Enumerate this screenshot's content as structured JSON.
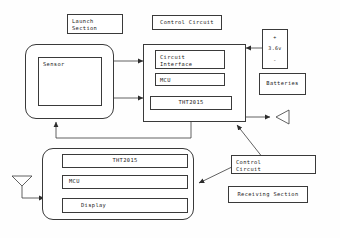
{
  "diagram": {
    "title_labels": {
      "launch_section": "Launch\nSection",
      "control_circuit_top": "Control Circuit",
      "batteries": "Batteries",
      "control_circuit_bottom": "Control\nCircuit",
      "receiving_section": "Receiving Section"
    },
    "transmitter": {
      "sensor_label": "Sensor",
      "control_blocks": [
        {
          "label": "Circuit\nInterface",
          "name": "circuit-interface-block"
        },
        {
          "label": "MCU",
          "name": "mcu-block"
        },
        {
          "label": "THT2015",
          "name": "tht2015-block"
        }
      ]
    },
    "battery": {
      "plus": "+",
      "voltage": "3.6v",
      "minus": "-"
    },
    "receiver": {
      "blocks": [
        {
          "label": "THT2015",
          "name": "receiver-tht2015-block"
        },
        {
          "label": "MCU",
          "name": "receiver-mcu-block"
        },
        {
          "label": "Display",
          "name": "receiver-display-block"
        }
      ]
    },
    "icons": {
      "tx_antenna": "transmit-antenna-icon",
      "rx_antenna": "receive-antenna-icon"
    },
    "colors": {
      "line": "#3a3a3a",
      "text": "#1b1b1b",
      "background": "#fefefe"
    }
  }
}
